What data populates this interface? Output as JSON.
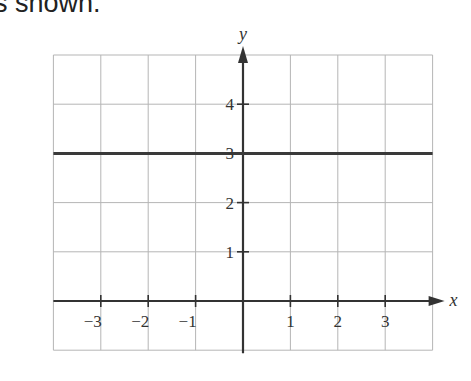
{
  "caption": "s shown.",
  "chart_data": {
    "type": "line",
    "title": "",
    "xlabel": "x",
    "ylabel": "y",
    "xlim": [
      -4,
      4
    ],
    "ylim": [
      -1,
      5
    ],
    "grid": true,
    "x_ticks": [
      -3,
      -2,
      -1,
      1,
      2,
      3
    ],
    "x_tick_labels": [
      "−3",
      "−2",
      "−1",
      "1",
      "2",
      "3"
    ],
    "y_ticks": [
      1,
      2,
      3,
      4
    ],
    "y_tick_labels": [
      "1",
      "2",
      "3",
      "4"
    ],
    "series": [
      {
        "name": "y = 3",
        "x": [
          -4,
          4
        ],
        "y": [
          3,
          3
        ]
      }
    ]
  },
  "colors": {
    "grid": "#b5b5b5",
    "axis": "#333333",
    "line": "#3a3a3a"
  }
}
